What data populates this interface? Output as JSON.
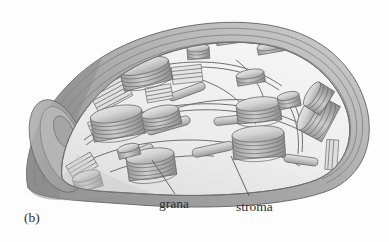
{
  "figure": {
    "panel_letter": "(b)",
    "background_color": "#fdfdfd"
  },
  "labels": [
    {
      "id": "grana",
      "text": "grana",
      "leader": "up-left-to-granum-stack"
    },
    {
      "id": "stroma",
      "text": "stroma",
      "leader": "up-left-to-stromal-space"
    }
  ],
  "label_text": {
    "grana": "grana",
    "stroma": "stroma"
  },
  "colors": {
    "outer_envelope": "#a9a9a9",
    "envelope_shadow": "#8f8f8f",
    "stroma_fill": "#e9e9e9",
    "stroma_fill_light": "#f2f2f2",
    "granum_top": "#d8d8d8",
    "granum_side": "#b4b4b4",
    "membrane_line": "#6e6e6e",
    "label_text": "#2e2e2e",
    "leader_line": "#5a5a5a"
  },
  "structures": {
    "envelope_label": "double membrane envelope",
    "grana_count": 12,
    "lamellae_label": "stroma lamellae",
    "cut_face_label": "cut-away face"
  }
}
